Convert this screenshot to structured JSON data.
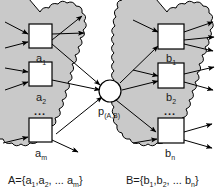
{
  "diagram": {
    "colors": {
      "cloud_fill": "#c9c9c9",
      "cloud_stroke": "#000000",
      "box_fill": "#ffffff",
      "box_stroke": "#000000",
      "center_fill": "#ffffff",
      "edge": "#000000",
      "background": "#ffffff",
      "text": "#1a1a1a"
    },
    "left_group": {
      "name": "cloud-A",
      "set_label": {
        "text": "A={a1,a2, ... am}",
        "base": "A={a",
        "sub1": "1",
        "mid": ",a",
        "sub2": "2",
        "ellipsis": ", ... a",
        "sub3": "m",
        "close": "}"
      },
      "nodes": [
        {
          "name": "node-a1",
          "base": "a",
          "sub": "1"
        },
        {
          "name": "node-a2",
          "base": "a",
          "sub": "2"
        },
        {
          "name": "node-am",
          "base": "a",
          "sub": "m"
        }
      ],
      "ellipsis": "..."
    },
    "right_group": {
      "name": "cloud-B",
      "set_label": {
        "text": "B={b1,b2, ... bn}",
        "base": "B={b",
        "sub1": "1",
        "mid": ",b",
        "sub2": "2",
        "ellipsis": ", ... b",
        "sub3": "n",
        "close": "}"
      },
      "nodes": [
        {
          "name": "node-b1",
          "base": "b",
          "sub": "1"
        },
        {
          "name": "node-b2",
          "base": "b",
          "sub": "2"
        },
        {
          "name": "node-bn",
          "base": "b",
          "sub": "n"
        }
      ],
      "ellipsis": "..."
    },
    "center": {
      "name": "joint-node",
      "base": "p",
      "sub": "(A,B)"
    }
  }
}
